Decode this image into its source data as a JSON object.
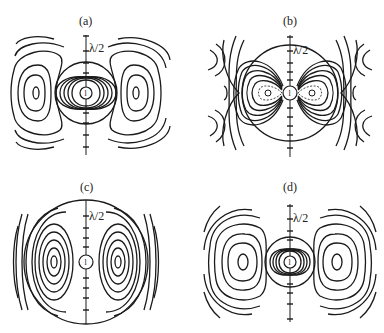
{
  "figure": {
    "line_color": "#1a1a1a",
    "background": "#ffffff",
    "panels": [
      {
        "id": "a",
        "label": "(a)",
        "scale_label": "λ/2",
        "dipole_label": "l",
        "cx": 86,
        "cy": 93
      },
      {
        "id": "b",
        "label": "(b)",
        "scale_label": "λ/2",
        "dipole_label": "l",
        "cx": 290,
        "cy": 93
      },
      {
        "id": "c",
        "label": "(c)",
        "scale_label": "λ/2",
        "dipole_label": "l",
        "cx": 86,
        "cy": 262
      },
      {
        "id": "d",
        "label": "(d)",
        "scale_label": "λ/2",
        "dipole_label": "l",
        "cx": 290,
        "cy": 262
      }
    ]
  }
}
